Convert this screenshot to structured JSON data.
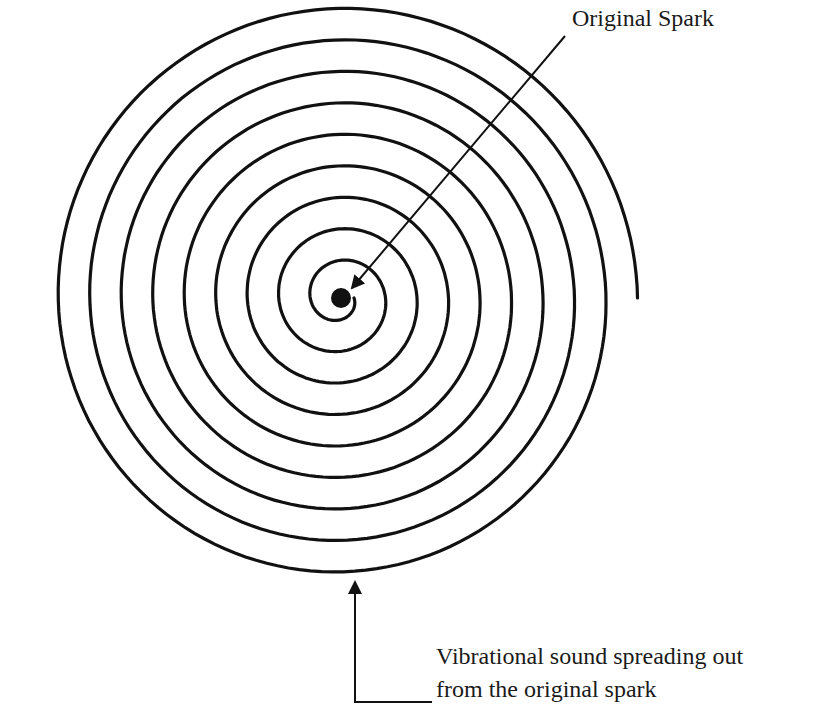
{
  "diagram": {
    "labels": {
      "spark": "Original Spark",
      "sound_line1": "Vibrational sound spreading out",
      "sound_line2": "from the original spark"
    },
    "spiral": {
      "center": [
        340,
        298
      ],
      "start_radius": 14,
      "turn_spacing": 31.5,
      "turns": 9.0,
      "stroke_color": "#111111",
      "stroke_width": 3.2
    },
    "spark_dot": {
      "center": [
        341,
        298
      ],
      "radius": 10,
      "color": "#111111"
    },
    "spark_pointer": {
      "from": [
        565,
        36
      ],
      "to": [
        352,
        288
      ]
    },
    "sound_pointer": {
      "arrow_tip": [
        355,
        582
      ],
      "corner": [
        355,
        702
      ],
      "end": [
        432,
        702
      ]
    },
    "colors": {
      "ink": "#111111",
      "background": "#ffffff"
    }
  }
}
